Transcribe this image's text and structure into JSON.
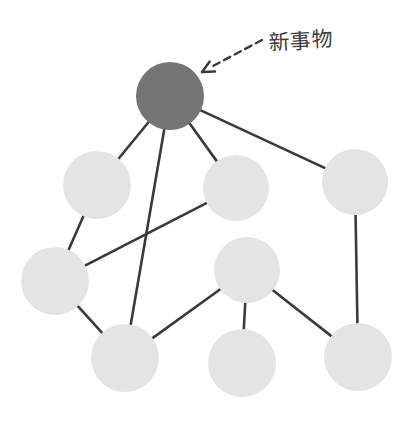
{
  "diagram": {
    "background_color": "#ffffff",
    "annotation": {
      "label": "新事物",
      "label_x": 268,
      "label_y": 24,
      "color": "#3c3c3c",
      "arrow": {
        "kind": "dashed-arrow",
        "from_x": 262,
        "from_y": 40,
        "to_x": 202,
        "to_y": 72,
        "color": "#3a3a3a",
        "dash": "7,5"
      }
    },
    "node_styles": {
      "highlight_fill": "#757575",
      "normal_fill": "#e4e4e4",
      "edge_color": "#3a3a3a",
      "edge_width": 2.6
    },
    "nodes": [
      {
        "id": "new",
        "label": "",
        "cx": 170,
        "cy": 96,
        "r": 34,
        "state": "highlight"
      },
      {
        "id": "upper-left",
        "label": "",
        "cx": 97,
        "cy": 185,
        "r": 34,
        "state": "normal"
      },
      {
        "id": "middle-top",
        "label": "",
        "cx": 236,
        "cy": 188,
        "r": 33,
        "state": "normal"
      },
      {
        "id": "right",
        "label": "",
        "cx": 355,
        "cy": 182,
        "r": 33,
        "state": "normal"
      },
      {
        "id": "left-middle",
        "label": "",
        "cx": 55,
        "cy": 281,
        "r": 34,
        "state": "normal"
      },
      {
        "id": "center-low",
        "label": "",
        "cx": 247,
        "cy": 270,
        "r": 33,
        "state": "normal"
      },
      {
        "id": "bottom-left",
        "label": "",
        "cx": 125,
        "cy": 358,
        "r": 34,
        "state": "normal"
      },
      {
        "id": "bottom-mid",
        "label": "",
        "cx": 242,
        "cy": 363,
        "r": 34,
        "state": "normal"
      },
      {
        "id": "bottom-right",
        "label": "",
        "cx": 358,
        "cy": 357,
        "r": 34,
        "state": "normal"
      }
    ],
    "edges": [
      {
        "from": "new",
        "to": "upper-left"
      },
      {
        "from": "new",
        "to": "middle-top"
      },
      {
        "from": "new",
        "to": "right"
      },
      {
        "from": "new",
        "to": "bottom-left"
      },
      {
        "from": "upper-left",
        "to": "left-middle"
      },
      {
        "from": "left-middle",
        "to": "middle-top"
      },
      {
        "from": "left-middle",
        "to": "bottom-left"
      },
      {
        "from": "bottom-left",
        "to": "center-low"
      },
      {
        "from": "center-low",
        "to": "bottom-mid"
      },
      {
        "from": "center-low",
        "to": "bottom-right"
      },
      {
        "from": "right",
        "to": "bottom-right"
      }
    ]
  }
}
